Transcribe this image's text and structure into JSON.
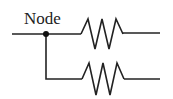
{
  "diagram": {
    "type": "circuit-schematic",
    "node_label": "Node",
    "components": [
      {
        "kind": "resistor",
        "branch": "top"
      },
      {
        "kind": "resistor",
        "branch": "bottom"
      }
    ],
    "colors": {
      "stroke": "#222222",
      "background": "#ffffff"
    }
  }
}
